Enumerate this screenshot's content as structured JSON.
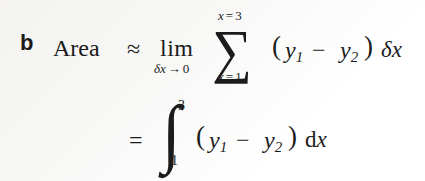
{
  "document": {
    "type": "math-expression-block",
    "item_label": "b",
    "quantity_name": "Area",
    "background_color": "#f6f5f3",
    "text_color": "#1b1b1b"
  },
  "line1": {
    "quantity": "Area",
    "relation": "≈",
    "limit_operator": "lim",
    "limit_variable": "δx",
    "limit_arrow": "→",
    "limit_target": "0",
    "limit_subscript": "δx → 0",
    "sum_symbol": "∑",
    "sum_upper_limit": "x = 3",
    "sum_lower_limit": "x = 1",
    "sum_upper_variable": "x",
    "sum_upper_value": "3",
    "sum_lower_variable": "x",
    "sum_lower_value": "1",
    "open_paren": "(",
    "term1_base": "y",
    "term1_sub": "1",
    "operator": "−",
    "term2_base": "y",
    "term2_sub": "2",
    "close_paren": ")",
    "measure_base": "δ",
    "measure_var": "x",
    "plain_text": "Area ≈ lim(δx→0) Σ[x=1 to x=3] (y₁ − y₂) δx"
  },
  "line2": {
    "relation": "=",
    "integral_symbol": "∫",
    "integral_upper_limit": "3",
    "integral_lower_limit": "1",
    "open_paren": "(",
    "term1_base": "y",
    "term1_sub": "1",
    "operator": "−",
    "term2_base": "y",
    "term2_sub": "2",
    "close_paren": ")",
    "differential_d": "d",
    "differential_var": "x",
    "plain_text": "= ∫[1 to 3] (y₁ − y₂) dx"
  }
}
